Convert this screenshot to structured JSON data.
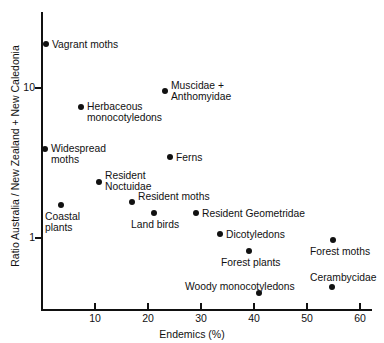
{
  "chart_data": {
    "type": "scatter",
    "title": "",
    "xlabel": "Endemics (%)",
    "ylabel": "Ratio Australia / New Zealand + New Caledonia",
    "xlim": [
      0,
      60
    ],
    "ylim": [
      0.35,
      25
    ],
    "yscale": "log",
    "xscale": "linear",
    "grid": false,
    "legend": "none",
    "xticks": [
      10,
      20,
      30,
      40,
      50,
      60
    ],
    "xtick_labels": [
      "10",
      "20",
      "30",
      "40",
      "50",
      "60"
    ],
    "yticks": [
      1,
      10
    ],
    "ytick_labels": [
      "1",
      "10"
    ],
    "points": [
      {
        "label": "Vagrant moths",
        "x": 0.8,
        "y": 19.6,
        "px": 46,
        "py": 44,
        "lx": 52,
        "ly": 39,
        "align": "left"
      },
      {
        "label": "Muscidae +\nAnthomyidae",
        "x": 23.2,
        "y": 9.5,
        "px": 165,
        "py": 91,
        "lx": 171,
        "ly": 80,
        "align": "left"
      },
      {
        "label": "Herbaceous\nmonocotyledons",
        "x": 7.4,
        "y": 7.5,
        "px": 81,
        "py": 107,
        "lx": 87,
        "ly": 101,
        "align": "left"
      },
      {
        "label": "Widespread\nmoths",
        "x": 0.6,
        "y": 3.0,
        "px": 45,
        "py": 149,
        "lx": 51,
        "ly": 143,
        "align": "left"
      },
      {
        "label": "Ferns",
        "x": 24.2,
        "y": 2.7,
        "px": 170,
        "py": 157,
        "lx": 176,
        "ly": 152,
        "align": "left"
      },
      {
        "label": "Resident\nNoctuidae",
        "x": 10.8,
        "y": 2.1,
        "px": 99,
        "py": 182,
        "lx": 105,
        "ly": 170,
        "align": "left"
      },
      {
        "label": "Coastal\nplants",
        "x": 3.6,
        "y": 1.65,
        "px": 61,
        "py": 205,
        "lx": 45,
        "ly": 211,
        "align": "left"
      },
      {
        "label": "Resident moths",
        "x": 17.0,
        "y": 1.72,
        "px": 132,
        "py": 202,
        "lx": 138,
        "ly": 191,
        "align": "left"
      },
      {
        "label": "Land birds",
        "x": 21.1,
        "y": 1.5,
        "px": 154,
        "py": 213,
        "lx": 131,
        "ly": 219,
        "align": "left"
      },
      {
        "label": "Resident Geometridae",
        "x": 29.0,
        "y": 1.5,
        "px": 196,
        "py": 213,
        "lx": 202,
        "ly": 208,
        "align": "left"
      },
      {
        "label": "Dicotyledons",
        "x": 33.6,
        "y": 1.06,
        "px": 220,
        "py": 234,
        "lx": 226,
        "ly": 229,
        "align": "left"
      },
      {
        "label": "Forest moths",
        "x": 55.0,
        "y": 0.96,
        "px": 333,
        "py": 240,
        "lx": 310,
        "ly": 246,
        "align": "left"
      },
      {
        "label": "Forest plants",
        "x": 39.0,
        "y": 0.82,
        "px": 249,
        "py": 251,
        "lx": 221,
        "ly": 257,
        "align": "left"
      },
      {
        "label": "Cerambycidae",
        "x": 54.8,
        "y": 0.5,
        "px": 332,
        "py": 287,
        "lx": 310,
        "ly": 272,
        "align": "left"
      },
      {
        "label": "Woody monocotyledons",
        "x": 41.0,
        "y": 0.46,
        "px": 259,
        "py": 293,
        "lx": 185,
        "ly": 281,
        "align": "left"
      }
    ]
  },
  "style": {
    "axis_color": "#111111",
    "marker_color": "#111111",
    "text_color": "#111111",
    "background": "#ffffff"
  }
}
